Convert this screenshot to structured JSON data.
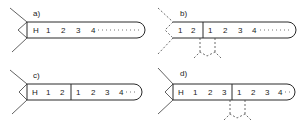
{
  "panels": [
    {
      "id": "a",
      "label": "a)",
      "head": "H",
      "cells": [
        "H",
        "1",
        "2",
        "3",
        "4"
      ],
      "trailing": "dotted",
      "divider": false
    },
    {
      "id": "b",
      "label": "b)",
      "cells_left": [
        "1",
        "2"
      ],
      "cells_right": [
        "1",
        "2",
        "3",
        "4"
      ],
      "trailing": "dotted",
      "divider": true,
      "cone_style": "dashed",
      "split_marks": "dashed-fork"
    },
    {
      "id": "c",
      "label": "c)",
      "cells_left": [
        "H",
        "1",
        "2"
      ],
      "cells_right": [
        "1",
        "2",
        "3",
        "4"
      ],
      "trailing": "dotted",
      "divider": true
    },
    {
      "id": "d",
      "label": "d)",
      "cells_left": [
        "H",
        "1",
        "2",
        "3"
      ],
      "cells_right": [
        "1",
        "2",
        "3",
        "4"
      ],
      "trailing": "dotted",
      "divider": true,
      "split_marks": "dashed-fork"
    }
  ],
  "colors": {
    "line": "#2a2a2a",
    "background": "#ffffff"
  }
}
